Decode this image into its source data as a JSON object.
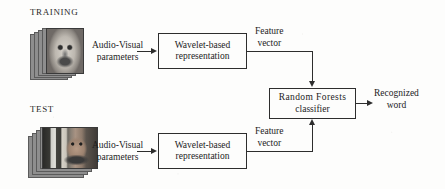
{
  "figure": {
    "type": "block-diagram",
    "background_color": "#fdfdfc",
    "line_color": "#2d2d2d"
  },
  "sections": {
    "training_label": "TRAINING",
    "test_label": "TEST"
  },
  "inputs": {
    "training_stack": {
      "name": "training-video-frames",
      "frame_count": 5,
      "orientation": "portrait"
    },
    "test_stack": {
      "name": "test-video-frames",
      "frame_count": 5,
      "orientation": "landscape"
    }
  },
  "edges": {
    "audio_visual_parameters": {
      "line1": "Audio-Visual",
      "line2": "parameters"
    },
    "feature_vector": {
      "line1": "Feature",
      "line2": "vector"
    },
    "output": {
      "line1": "Recognized",
      "line2": "word"
    }
  },
  "blocks": {
    "wavelet_training": {
      "line1": "Wavelet-based",
      "line2": "representation"
    },
    "wavelet_test": {
      "line1": "Wavelet-based",
      "line2": "representation"
    },
    "classifier": {
      "line1": "Random Forests",
      "line2": "classifier"
    }
  }
}
